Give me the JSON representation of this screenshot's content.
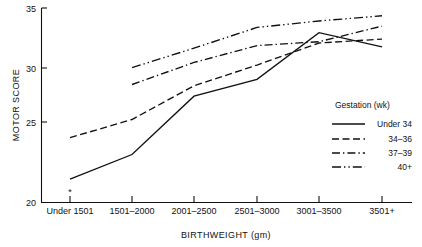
{
  "chart_data": {
    "type": "line",
    "title": "",
    "xlabel": "BIRTHWEIGHT (gm)",
    "ylabel": "MOTOR SCORE",
    "categories": [
      "Under 1501",
      "1501–2000",
      "2001–2500",
      "2501–3000",
      "3001–3500",
      "3501+"
    ],
    "ylim": [
      20,
      35
    ],
    "yticks": [
      20,
      25,
      30,
      35
    ],
    "ytick_labels": [
      "20",
      "25",
      "30",
      "35"
    ],
    "grid": false,
    "legend_position": "inside-right",
    "legend_title": "Gestation (wk)",
    "series": [
      {
        "name": "Under 34",
        "style": "solid",
        "values": [
          21.8,
          23.7,
          28.2,
          29.5,
          33.1,
          32.0
        ]
      },
      {
        "name": "34–36",
        "style": "dashed",
        "values": [
          25.0,
          26.4,
          29.0,
          30.6,
          32.3,
          32.6
        ]
      },
      {
        "name": "37–39",
        "style": "dash-dot",
        "values": [
          null,
          29.1,
          30.8,
          32.1,
          32.4,
          33.6
        ]
      },
      {
        "name": "40+",
        "style": "dash-dot-dot",
        "values": [
          null,
          30.4,
          31.9,
          33.5,
          34.0,
          34.4
        ]
      }
    ],
    "annotations": [
      {
        "name": "asterisk-marker",
        "text": "*",
        "category": "Under 1501",
        "value": 20.6
      }
    ],
    "colors": {
      "line": "#111111",
      "background": "#ffffff"
    }
  },
  "axes": {
    "y_axis_label": "MOTOR SCORE",
    "x_axis_label": "BIRTHWEIGHT (gm)"
  },
  "legend": {
    "title": "Gestation (wk)",
    "entries": [
      {
        "label": "Under 34",
        "style": "solid"
      },
      {
        "label": "34–36",
        "style": "dashed"
      },
      {
        "label": "37–39",
        "style": "dash-dot"
      },
      {
        "label": "40+",
        "style": "dash-dot-dot"
      }
    ]
  }
}
